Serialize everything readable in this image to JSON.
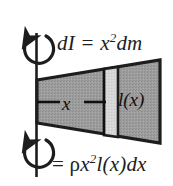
{
  "figure": {
    "background_color": "#ffffff",
    "ink_color": "#1d1d1d",
    "body_fill_color": "#9d9d9d",
    "slice_fill_color": "#d3d3d3",
    "equations": {
      "top": {
        "full_text": "dI = x2dm",
        "lead": "dI = x",
        "exponent": "2",
        "tail": "dm"
      },
      "bottom": {
        "full_text": "= ρx2l(x)dx",
        "lead_equals": "= ",
        "rho": "ρ",
        "variable": "x",
        "exponent": "2",
        "tail": "l(x)dx"
      }
    },
    "labels": {
      "distance": "x",
      "length_function": "l(x)"
    },
    "icons": {
      "axis": "rotation-axis-line",
      "top_arrow": "counterclockwise-rotation-arrow",
      "bottom_arrow": "counterclockwise-rotation-arrow",
      "dimension_line": "dimension-line-x"
    }
  }
}
